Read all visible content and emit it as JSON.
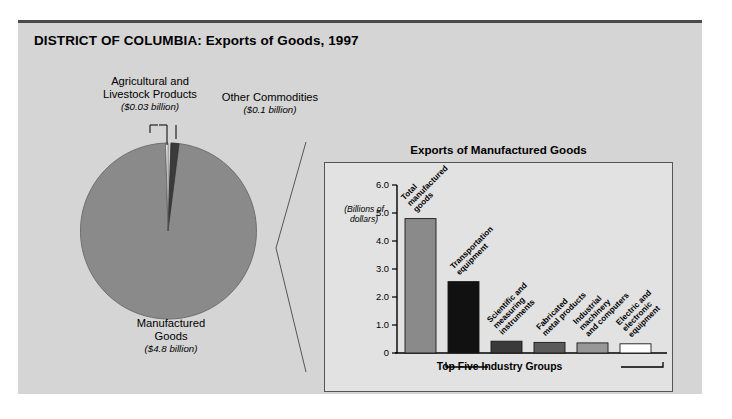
{
  "figure": {
    "title": "DISTRICT OF COLUMBIA: Exports of Goods, 1997"
  },
  "pie": {
    "callouts": [
      {
        "id": "agricultural",
        "label": "Agricultural and\nLivestock Products",
        "line1": "Agricultural and",
        "line2": "Livestock Products",
        "value": "($0.03 billion)"
      },
      {
        "id": "other",
        "label": "Other Commodities",
        "line1": "Other Commodities",
        "line2": "",
        "value": "($0.1 billion)"
      },
      {
        "id": "manufactured",
        "label": "Manufactured Goods",
        "line1": "Manufactured",
        "line2": "Goods",
        "value": "($4.8 billion)"
      }
    ]
  },
  "bar_panel": {
    "title": "Exports of Manufactured Goods",
    "axis_unit_line1": "(Billions of",
    "axis_unit_line2": "dollars)",
    "bracket_label": "Top Five Industry Groups"
  },
  "chart_data": [
    {
      "type": "pie",
      "title": "DISTRICT OF COLUMBIA: Exports of Goods, 1997",
      "unit": "billions of dollars",
      "categories": [
        "Manufactured Goods",
        "Other Commodities",
        "Agricultural and Livestock Products"
      ],
      "values": [
        4.8,
        0.1,
        0.03
      ],
      "labels": [
        "($4.8 billion)",
        "($0.1 billion)",
        "($0.03 billion)"
      ],
      "colors": [
        "#8a8a8a",
        "#3b3b3b",
        "#ffffff"
      ],
      "legend": "callouts"
    },
    {
      "type": "bar",
      "title": "Exports of Manufactured Goods",
      "xlabel": "Top Five Industry Groups",
      "ylabel": "(Billions of dollars)",
      "ylim": [
        0,
        6.0
      ],
      "yticks": [
        "0",
        "1.0",
        "2.0",
        "3.0",
        "4.0",
        "5.0",
        "6.0"
      ],
      "ytick_values": [
        0,
        1.0,
        2.0,
        3.0,
        4.0,
        5.0,
        6.0
      ],
      "grid": false,
      "categories": [
        "Total manufactured goods",
        "Transportation equipment",
        "Scientific and measuring instruments",
        "Fabricated metal products",
        "Industrial machinery and computers",
        "Electric and electronic equipment"
      ],
      "category_lines": [
        [
          "Total",
          "manufactured",
          "goods"
        ],
        [
          "Transportation",
          "equipment"
        ],
        [
          "Scientific and",
          "measuring",
          "instruments"
        ],
        [
          "Fabricated",
          "metal products"
        ],
        [
          "Industrial",
          "machinery",
          "and computers"
        ],
        [
          "Electric and",
          "electronic",
          "equipment"
        ]
      ],
      "values": [
        4.8,
        2.55,
        0.42,
        0.38,
        0.36,
        0.33
      ],
      "colors": [
        "#8a8a8a",
        "#111111",
        "#3a3a3a",
        "#5a5a5a",
        "#989898",
        "#ffffff"
      ]
    }
  ]
}
